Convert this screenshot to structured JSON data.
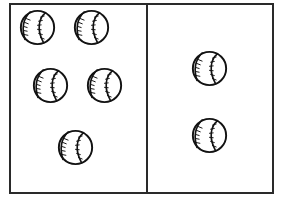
{
  "page": {
    "background_color": "#ffffff",
    "ink_color": "#121212",
    "frame_color": "#2a2a2a"
  },
  "frame": {
    "border_style": "solid rectangle",
    "divider": "vertical line splitting frame into two equal panels"
  },
  "panels": [
    {
      "id": "left",
      "name": "left-group",
      "count": 5,
      "item_name": "baseball",
      "items": [
        {
          "label": "baseball-1",
          "x": 19,
          "y": 9,
          "size": 37,
          "rotation": 0
        },
        {
          "label": "baseball-2",
          "x": 73,
          "y": 9,
          "size": 37,
          "rotation": 0
        },
        {
          "label": "baseball-3",
          "x": 32,
          "y": 67,
          "size": 37,
          "rotation": 0
        },
        {
          "label": "baseball-4",
          "x": 86,
          "y": 67,
          "size": 37,
          "rotation": 0
        },
        {
          "label": "baseball-5",
          "x": 57,
          "y": 129,
          "size": 37,
          "rotation": 0
        }
      ]
    },
    {
      "id": "right",
      "name": "right-group",
      "count": 2,
      "item_name": "baseball",
      "items": [
        {
          "label": "baseball-6",
          "x": 191,
          "y": 50,
          "size": 37,
          "rotation": 0
        },
        {
          "label": "baseball-7",
          "x": 191,
          "y": 117,
          "size": 37,
          "rotation": 0
        }
      ]
    }
  ]
}
